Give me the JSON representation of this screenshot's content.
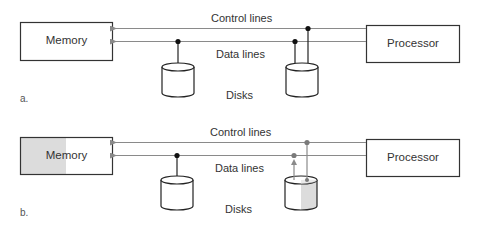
{
  "panels": [
    {
      "id": "a",
      "label": "a.",
      "memory_label": "Memory",
      "processor_label": "Processor",
      "control_lines_label": "Control lines",
      "data_lines_label": "Data lines",
      "disks_label": "Disks",
      "memory_highlighted": false,
      "disk2_highlighted": false
    },
    {
      "id": "b",
      "label": "b.",
      "memory_label": "Memory",
      "processor_label": "Processor",
      "control_lines_label": "Control lines",
      "data_lines_label": "Data lines",
      "disks_label": "Disks",
      "memory_highlighted": true,
      "disk2_highlighted": true
    }
  ],
  "colors": {
    "line": "#8a8a8a",
    "box_stroke": "#333333",
    "junction": "#111111",
    "junction_active": "#7a7a7a",
    "highlight_fill": "#dcdcdc"
  }
}
